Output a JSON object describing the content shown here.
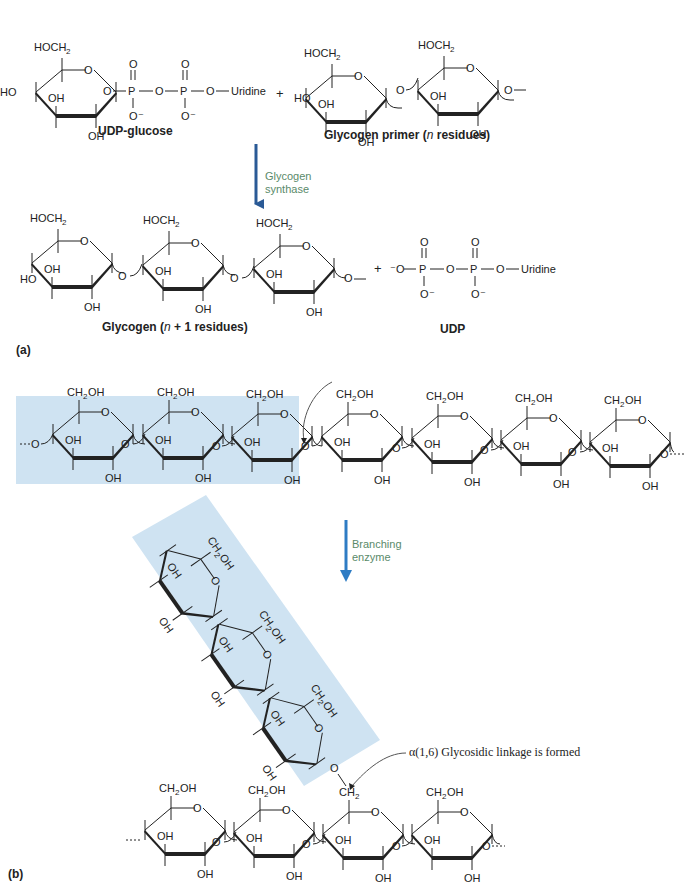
{
  "figure": {
    "colors": {
      "arrow_a": "#2a5a96",
      "arrow_b": "#2e7cc4",
      "highlight": "#cfe3f2",
      "enzyme_text": "#5a8a6a",
      "ink": "#222222"
    },
    "panel_a": {
      "label": "(a)",
      "reactants": {
        "udp_glucose": {
          "name": "UDP-glucose",
          "ring_substituents": [
            "HOCH2",
            "O",
            "OH",
            "HO",
            "OH"
          ],
          "chain": [
            "O",
            "P",
            "O",
            "P",
            "O",
            "Uridine"
          ],
          "phosphate_oxygens": [
            "O",
            "O",
            "O⁻",
            "O⁻"
          ]
        },
        "plus": "+",
        "primer": {
          "name": "Glycogen primer (n residues)",
          "name_prefix": "Glycogen primer (",
          "name_italic": "n",
          "name_suffix": " residues)",
          "residues_drawn": 2
        }
      },
      "enzyme": {
        "name": "Glycogen\nsynthase",
        "arrow_icon": "down-arrow-icon"
      },
      "products": {
        "glycogen": {
          "name": "Glycogen (n + 1 residues)",
          "name_prefix": "Glycogen  (",
          "name_italic": "n",
          "name_suffix": " + 1 residues)",
          "residues_drawn": 3
        },
        "plus": "+",
        "udp": {
          "name": "UDP",
          "chain": [
            "⁻O",
            "P",
            "O",
            "P",
            "O",
            "Uridine"
          ]
        }
      }
    },
    "panel_b": {
      "label": "(b)",
      "linear_chain": {
        "residues_drawn": 7,
        "highlighted_residues": 3,
        "substituent": "CH2OH",
        "terminal": "O···"
      },
      "enzyme": {
        "name": "Branching\nenzyme",
        "arrow_icon": "down-arrow-icon"
      },
      "transferred_segment": {
        "residues_drawn": 3,
        "substituent": "CH2OH"
      },
      "branched_chain": {
        "residues_drawn": 5,
        "branch_point_substituent": "CH2",
        "substituent": "CH2OH"
      },
      "annotation": "α(1,6) Glycosidic linkage is formed"
    },
    "atoms": {
      "hoch2": "HOCH",
      "ch2oh_pre": "CH",
      "ch2oh_post": "OH",
      "sub2": "2",
      "o": "O",
      "oh": "OH",
      "ho": "HO",
      "p": "P",
      "ominus": "O⁻",
      "minus_o": "⁻O",
      "uridine": "Uridine",
      "ch2": "CH"
    }
  }
}
